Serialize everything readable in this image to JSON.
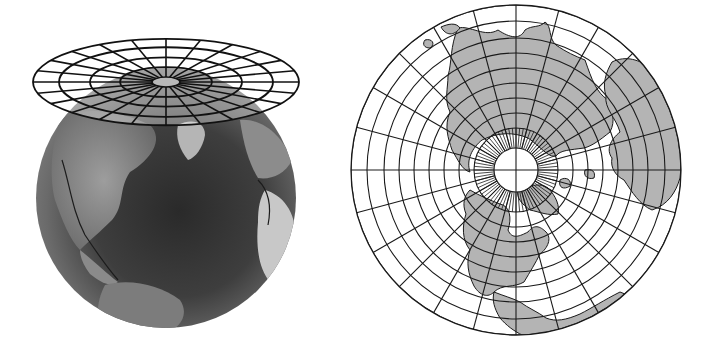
{
  "figure": {
    "width": 716,
    "height": 355,
    "background": "#ffffff"
  },
  "left_panel": {
    "description": "Globe with azimuthal projection plane tangent at north pole",
    "globe": {
      "cx": 166,
      "cy": 198,
      "r": 130,
      "colors": {
        "ocean_dark": "#2b2b2b",
        "ocean_mid": "#555555",
        "land_light": "#9a9a9a",
        "land_bright": "#d0d0d0",
        "rim": "#6a6a6a"
      }
    },
    "projection_plane": {
      "cx": 166,
      "cy": 82,
      "ring_radii_x": [
        133,
        107,
        76,
        46
      ],
      "aspect": 0.325,
      "pole_rx": 14,
      "pole_ry": 5,
      "spoke_count": 24,
      "line_color": "#111111",
      "pole_fill": "#b8b8b8"
    }
  },
  "right_panel": {
    "description": "Polar azimuthal map of the northern hemisphere",
    "map": {
      "cx": 516,
      "cy": 170,
      "r": 165,
      "pole_circle_r": 22,
      "hatch_ring_r": 42,
      "ring_radii": [
        42,
        57,
        72,
        87,
        102,
        117,
        132,
        149,
        165
      ],
      "meridian_count": 24,
      "hatch_count": 72,
      "colors": {
        "land": "#b4b4b4",
        "water": "#ffffff",
        "grid": "#1a1a1a"
      }
    },
    "landmasses": [
      "Eurasia",
      "Africa",
      "North America",
      "Greenland",
      "Central America"
    ]
  }
}
